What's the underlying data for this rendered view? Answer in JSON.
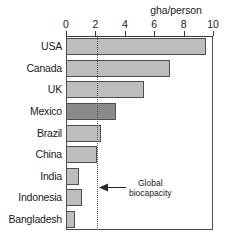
{
  "chart_data": {
    "type": "bar",
    "orientation": "horizontal",
    "title": "",
    "xlabel": "gha/person",
    "ylabel": "",
    "xlim": [
      0,
      10
    ],
    "grid": false,
    "legend": null,
    "categories": [
      "USA",
      "Canada",
      "UK",
      "Mexico",
      "Brazil",
      "China",
      "India",
      "Indonesia",
      "Bangladesh"
    ],
    "values": [
      9.5,
      7.1,
      5.3,
      3.4,
      2.4,
      2.1,
      0.9,
      1.1,
      0.6
    ],
    "xticks": [
      0,
      2,
      4,
      6,
      8,
      10
    ],
    "xtick_labels": [
      "0",
      "2",
      "4",
      "6",
      "8",
      "10"
    ],
    "highlighted_category": "Mexico",
    "annotations": [
      {
        "name": "global-biocapacity",
        "text_line1": "Global",
        "text_line2": "biocapacity",
        "value": 2.1,
        "style": "dotted-vertical-line-with-left-arrow"
      }
    ],
    "colors": {
      "bar_fill": "#bdbdbd",
      "bar_highlight_fill": "#8a8a8a",
      "bar_stroke": "#4f4f4f",
      "axis": "#3a3a3a",
      "reference_line": "#555555",
      "text": "#1a1a1a",
      "background": "#ffffff"
    }
  }
}
